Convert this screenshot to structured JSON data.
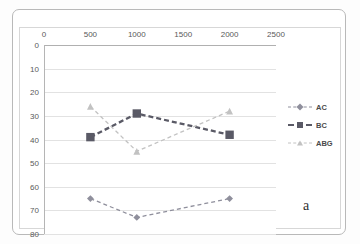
{
  "figure": {
    "panel_label": "a"
  },
  "legend": {
    "position": "right",
    "items": [
      {
        "name": "AC",
        "marker": "diamond-marker",
        "color": "#8f8f9c",
        "dash": "dashed"
      },
      {
        "name": "BC",
        "marker": "square-marker",
        "color": "#5a5a66",
        "dash": "dashed"
      },
      {
        "name": "ABG",
        "marker": "triangle-marker",
        "color": "#c2c2c2",
        "dash": "dashed"
      }
    ]
  },
  "chart_data": {
    "type": "line",
    "title": "",
    "subtitle": "",
    "xlabel": "",
    "ylabel": "",
    "x": [
      500,
      1000,
      2000
    ],
    "xticks": [
      0,
      500,
      1000,
      1500,
      2000,
      2500
    ],
    "yticks": [
      0,
      10,
      20,
      30,
      40,
      50,
      60,
      70,
      80
    ],
    "xlim": [
      0,
      2500
    ],
    "ylim": [
      0,
      80
    ],
    "y_axis_inverted": true,
    "x_axis_position": "top",
    "grid": true,
    "legend_position": "right",
    "series": [
      {
        "name": "AC",
        "values": [
          65,
          73,
          65
        ],
        "color": "#8f8f9c",
        "marker": "diamond"
      },
      {
        "name": "BC",
        "values": [
          39,
          29,
          38
        ],
        "color": "#5a5a66",
        "marker": "square"
      },
      {
        "name": "ABG",
        "values": [
          26,
          45,
          28
        ],
        "color": "#c2c2c2",
        "marker": "triangle"
      }
    ]
  }
}
